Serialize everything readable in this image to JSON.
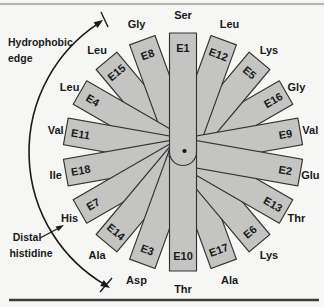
{
  "wheel": {
    "spokes": [
      {
        "pos": "E1",
        "residue": "Ser",
        "angle": 0
      },
      {
        "pos": "E2",
        "residue": "Glu",
        "angle": 100
      },
      {
        "pos": "E3",
        "residue": "Asp",
        "angle": 200
      },
      {
        "pos": "E4",
        "residue": "Leu",
        "angle": 300
      },
      {
        "pos": "E5",
        "residue": "Lys",
        "angle": 40
      },
      {
        "pos": "E6",
        "residue": "Lys",
        "angle": 140
      },
      {
        "pos": "E7",
        "residue": "His",
        "angle": 240
      },
      {
        "pos": "E8",
        "residue": "Gly",
        "angle": 340
      },
      {
        "pos": "E9",
        "residue": "Val",
        "angle": 80
      },
      {
        "pos": "E10",
        "residue": "Thr",
        "angle": 180
      },
      {
        "pos": "E11",
        "residue": "Val",
        "angle": 280
      },
      {
        "pos": "E12",
        "residue": "Leu",
        "angle": 20
      },
      {
        "pos": "E13",
        "residue": "Thr",
        "angle": 120
      },
      {
        "pos": "E14",
        "residue": "Ala",
        "angle": 220
      },
      {
        "pos": "E15",
        "residue": "Leu",
        "angle": 320
      },
      {
        "pos": "E16",
        "residue": "Gly",
        "angle": 60
      },
      {
        "pos": "E17",
        "residue": "Ala",
        "angle": 160
      },
      {
        "pos": "E18",
        "residue": "Ile",
        "angle": 260
      }
    ],
    "colors": {
      "paddle_fill": "#c4c4c2",
      "paddle_stroke": "#333333",
      "text": "#1a1a1a",
      "background": "#f6f6f4"
    }
  },
  "annotations": {
    "hydrophobic_edge": {
      "line1": "Hydrophobic",
      "line2": "edge"
    },
    "distal_histidine": {
      "line1": "Distal",
      "line2": "histidine"
    }
  }
}
